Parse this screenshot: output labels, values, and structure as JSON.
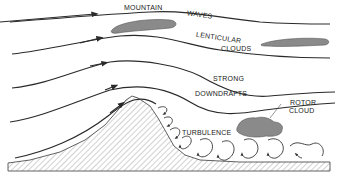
{
  "diagram": {
    "labels": {
      "mountain": "MOUNTAIN",
      "waves": "WAVES",
      "lenticular": "LENTICULAR",
      "clouds": "CLOUDS",
      "strong": "STRONG",
      "downdrafts": "DOWNDRAFTS",
      "rotor": "ROTOR",
      "rotor_cloud": "CLOUD",
      "turbulence": "TURBULENCE"
    },
    "colors": {
      "line": "#2a2a2a",
      "cloud_fill": "#8a8a8a",
      "hatch": "#9a9a9a",
      "background": "#ffffff"
    }
  }
}
